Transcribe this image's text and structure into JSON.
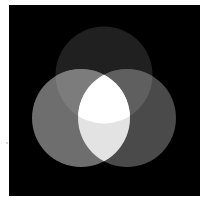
{
  "figure": {
    "background_color": "#ffffff",
    "panel": {
      "x": 9,
      "y": 5,
      "width": 191,
      "height": 191,
      "color": "#000000"
    },
    "circles": [
      {
        "id": "top",
        "cx": 104,
        "cy": 75,
        "r": 48.5
      },
      {
        "id": "left",
        "cx": 81,
        "cy": 118,
        "r": 49
      },
      {
        "id": "right",
        "cx": 127,
        "cy": 118,
        "r": 49
      }
    ],
    "region_colors": {
      "top_only": "#202020",
      "left_only": "#6e6e6e",
      "right_only": "#4a4a4a",
      "top_left": "#7c7c7c",
      "top_right": "#5f5f5f",
      "left_right": "#e3e3e3",
      "all_three": "#ffffff"
    }
  }
}
